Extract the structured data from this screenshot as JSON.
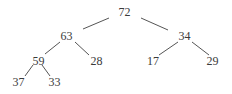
{
  "diagram": {
    "type": "binary-tree",
    "nodes": [
      {
        "id": "n72",
        "label": "72",
        "x": 124.5,
        "y": 16
      },
      {
        "id": "n63",
        "label": "63",
        "x": 66.5,
        "y": 39.5
      },
      {
        "id": "n34",
        "label": "34",
        "x": 184.5,
        "y": 39.5
      },
      {
        "id": "n59",
        "label": "59",
        "x": 38.5,
        "y": 64.5
      },
      {
        "id": "n28",
        "label": "28",
        "x": 96.5,
        "y": 64.5
      },
      {
        "id": "n17",
        "label": "17",
        "x": 153,
        "y": 64.5
      },
      {
        "id": "n29",
        "label": "29",
        "x": 212.5,
        "y": 64.5
      },
      {
        "id": "n37",
        "label": "37",
        "x": 18.5,
        "y": 86
      },
      {
        "id": "n33",
        "label": "33",
        "x": 54.5,
        "y": 86
      }
    ],
    "edges": [
      {
        "from": "72",
        "to": "63",
        "x1": 109,
        "y1": 18,
        "x2": 83,
        "y2": 29
      },
      {
        "from": "72",
        "to": "34",
        "x1": 141,
        "y1": 18,
        "x2": 168,
        "y2": 30
      },
      {
        "from": "63",
        "to": "59",
        "x1": 60,
        "y1": 42,
        "x2": 45,
        "y2": 54
      },
      {
        "from": "63",
        "to": "28",
        "x1": 75,
        "y1": 42,
        "x2": 89,
        "y2": 55
      },
      {
        "from": "34",
        "to": "17",
        "x1": 178,
        "y1": 42,
        "x2": 159,
        "y2": 55
      },
      {
        "from": "34",
        "to": "29",
        "x1": 192,
        "y1": 42,
        "x2": 209,
        "y2": 55
      },
      {
        "from": "59",
        "to": "37",
        "x1": 33,
        "y1": 65,
        "x2": 25,
        "y2": 76
      },
      {
        "from": "59",
        "to": "33",
        "x1": 42,
        "y1": 65,
        "x2": 50,
        "y2": 76
      }
    ]
  }
}
